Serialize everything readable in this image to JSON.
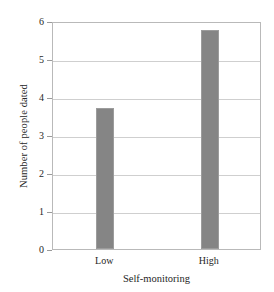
{
  "chart_data": {
    "type": "bar",
    "title": "",
    "categories": [
      "Low",
      "High"
    ],
    "values": [
      3.7,
      5.77
    ],
    "xlabel": "Self-monitoring",
    "ylabel": "Number of people dated",
    "ylim": [
      0,
      6
    ],
    "ytick_labels": [
      "0",
      "1",
      "2",
      "3",
      "4",
      "5",
      "6"
    ],
    "ytick_values": [
      0,
      1,
      2,
      3,
      4,
      5,
      6
    ],
    "grid": "horizontal",
    "legend": "none",
    "bar_color": "#858585",
    "bar_edge_color": "#9c9c9c",
    "gridline_color": "#cfcfcf",
    "frame_color": "#b9b9b9",
    "background": "#ffffff",
    "series": [
      {
        "name": "Number of people dated",
        "values": [
          3.7,
          5.77
        ]
      }
    ]
  }
}
